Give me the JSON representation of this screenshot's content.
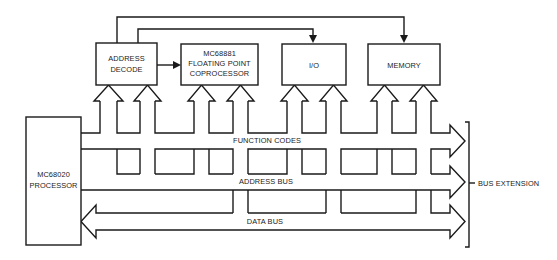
{
  "diagram": {
    "blocks": {
      "processor": [
        "MC68020",
        "PROCESSOR"
      ],
      "address_decode": [
        "ADDRESS",
        "DECODE"
      ],
      "fpcp": [
        "MC68881",
        "FLOATING POINT",
        "COPROCESSOR"
      ],
      "io": [
        "I/O"
      ],
      "memory": [
        "MEMORY"
      ]
    },
    "buses": {
      "function_codes": "FUNCTION CODES",
      "address_bus": "ADDRESS BUS",
      "data_bus": "DATA BUS"
    },
    "bus_extension": "BUS EXTENSION",
    "colors": {
      "line": "#1a1a1a",
      "background": "#ffffff"
    }
  }
}
